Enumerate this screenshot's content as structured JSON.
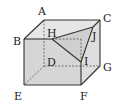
{
  "diagram": {
    "type": "cube",
    "vertices": {
      "A": {
        "label": "A",
        "x": 44,
        "y": 20
      },
      "B": {
        "label": "B",
        "x": 24,
        "y": 39
      },
      "C": {
        "label": "C",
        "x": 100,
        "y": 20
      },
      "D": {
        "label": "D",
        "x": 44,
        "y": 66
      },
      "E": {
        "label": "E",
        "x": 24,
        "y": 85
      },
      "F": {
        "label": "F",
        "x": 81,
        "y": 85
      },
      "G": {
        "label": "G",
        "x": 100,
        "y": 66
      },
      "H": {
        "label": "H",
        "x": 52,
        "y": 39
      },
      "I": {
        "label": "I",
        "x": 81,
        "y": 62
      },
      "J": {
        "label": "J",
        "x": 93,
        "y": 27
      }
    },
    "colors": {
      "stroke": "#333333",
      "face_front": "#d4d4d4",
      "face_top": "#e4e4e4",
      "face_right": "#dcdcdc",
      "cut_face": "#c8c8c8"
    }
  }
}
